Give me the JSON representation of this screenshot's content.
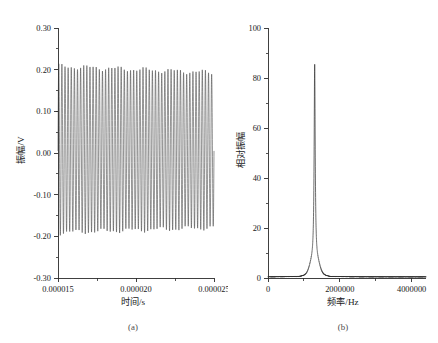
{
  "figure": {
    "panels": [
      {
        "caption": "(a)",
        "xlabel": "时间/s",
        "ylabel": "振幅/V",
        "xticks": [
          "0.000015",
          "0.000020",
          "0.000025"
        ],
        "yticks": [
          "-0.30",
          "-0.20",
          "-0.10",
          "0.00",
          "0.10",
          "0.20",
          "0.30"
        ]
      },
      {
        "caption": "(b)",
        "xlabel": "频率/Hz",
        "ylabel": "相对振幅",
        "xticks": [
          "0",
          "2000000",
          "4000000"
        ],
        "yticks": [
          "0",
          "20",
          "40",
          "60",
          "80",
          "100"
        ]
      }
    ]
  },
  "chart_data": [
    {
      "type": "line",
      "title": "",
      "subtitle": "(a)",
      "xlabel": "时间/s",
      "ylabel": "振幅/V",
      "xlim": [
        1.5e-05,
        2.5e-05
      ],
      "ylim": [
        -0.3,
        0.3
      ],
      "xticks": [
        1.5e-05,
        2e-05,
        2.5e-05
      ],
      "xtick_labels": [
        "0.000015",
        "0.000020",
        "0.000025"
      ],
      "yticks": [
        -0.3,
        -0.2,
        -0.1,
        0.0,
        0.1,
        0.2,
        0.3
      ],
      "ytick_labels": [
        "-0.30",
        "-0.20",
        "-0.10",
        "0.00",
        "0.10",
        "0.20",
        "0.30"
      ],
      "y_minor_step": 0.05,
      "grid": false,
      "legend": null,
      "description": "Dense continuous sinusoidal oscillation filling the full time window; nearly constant amplitude envelope.",
      "signal": {
        "waveform": "sine",
        "frequency_hz": 1300000,
        "render_cycles": 50,
        "amplitude_v": 0.2,
        "offset_v": 0.005,
        "envelope_peak_positive_v": 0.205,
        "envelope_peak_negative_v": -0.195,
        "envelope_start_positive_v": 0.203,
        "envelope_end_positive_v": 0.188,
        "envelope_start_negative_v": -0.196,
        "envelope_end_negative_v": -0.184
      }
    },
    {
      "type": "line",
      "title": "",
      "subtitle": "(b)",
      "xlabel": "频率/Hz",
      "ylabel": "相对振幅",
      "xlim": [
        0,
        4400000
      ],
      "ylim": [
        0,
        100
      ],
      "xticks": [
        0,
        2000000,
        4000000
      ],
      "xtick_labels": [
        "0",
        "2000000",
        "4000000"
      ],
      "yticks": [
        0,
        20,
        40,
        60,
        80,
        100
      ],
      "ytick_labels": [
        "0",
        "20",
        "40",
        "60",
        "80",
        "100"
      ],
      "y_minor_step": 10,
      "grid": false,
      "legend": null,
      "description": "Frequency spectrum with a single very sharp resonance peak near 1.3 MHz rising to about 85, sitting on a narrow broadened base and a flat near-zero baseline elsewhere.",
      "peak": {
        "center_hz": 1300000,
        "height": 85,
        "sharp_half_width_hz": 18000,
        "base_half_width_hz": 160000,
        "base_height": 6
      },
      "baseline": 0.6
    }
  ]
}
